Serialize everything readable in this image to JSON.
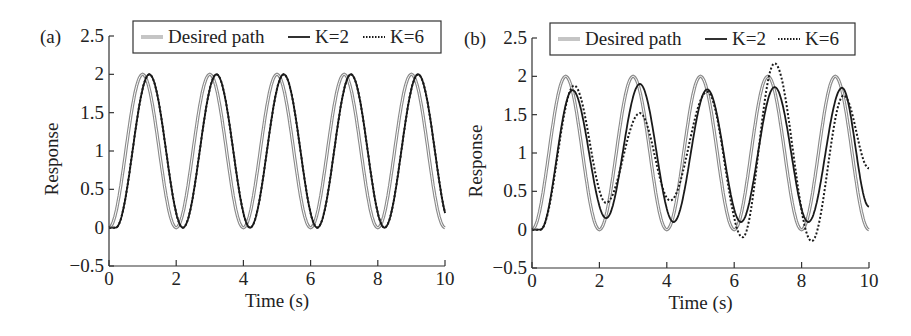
{
  "chart_data": [
    {
      "panel_label": "(a)",
      "type": "line",
      "xlabel": "Time (s)",
      "ylabel": "Response",
      "xlim": [
        0,
        10
      ],
      "ylim": [
        -0.5,
        2.5
      ],
      "xticks": [
        "0",
        "2",
        "4",
        "6",
        "8",
        "10"
      ],
      "yticks": [
        "−0.5",
        "0",
        "0.5",
        "1",
        "1.5",
        "2",
        "2.5"
      ],
      "grid": false,
      "legend": {
        "position": "top-inside",
        "entries": [
          "Desired path",
          "K=2",
          "K=6"
        ]
      },
      "series": [
        {
          "name": "Desired path",
          "style": "gray-double",
          "model": {
            "amp": 1,
            "offset": 1,
            "period": 2,
            "delay": 0
          }
        },
        {
          "name": "K=2",
          "style": "solid",
          "model": {
            "amp": 1,
            "offset": 1,
            "period": 2,
            "delay": 0.2
          }
        },
        {
          "name": "K=6",
          "style": "dotted",
          "model": {
            "amp": 1,
            "offset": 1,
            "period": 2,
            "delay": 0.2
          }
        }
      ]
    },
    {
      "panel_label": "(b)",
      "type": "line",
      "xlabel": "Time (s)",
      "ylabel": "Response",
      "xlim": [
        0,
        10
      ],
      "ylim": [
        -0.5,
        2.5
      ],
      "xticks": [
        "0",
        "2",
        "4",
        "6",
        "8",
        "10"
      ],
      "yticks": [
        "−0.5",
        "0",
        "0.5",
        "1",
        "1.5",
        "2",
        "2.5"
      ],
      "grid": false,
      "legend": {
        "position": "top-inside",
        "entries": [
          "Desired path",
          "K=2",
          "K=6"
        ]
      },
      "series": [
        {
          "name": "Desired path",
          "style": "gray-double",
          "x": [
            0,
            1,
            2,
            3,
            4,
            5,
            6,
            7,
            8,
            9,
            10
          ],
          "y": [
            0,
            2,
            0,
            2,
            0,
            2,
            0,
            2,
            0,
            2,
            0
          ]
        },
        {
          "name": "K=2",
          "style": "solid",
          "x": [
            0,
            0.25,
            1.2,
            2.2,
            3.2,
            4.2,
            5.2,
            6.2,
            7.2,
            8.2,
            9.2,
            10
          ],
          "y": [
            0,
            0,
            1.82,
            0.15,
            1.9,
            0.1,
            1.83,
            0.1,
            1.86,
            0.1,
            1.85,
            0.3
          ]
        },
        {
          "name": "K=6",
          "style": "dotted",
          "x": [
            0,
            0.25,
            1.25,
            2.2,
            3.2,
            4.1,
            5.2,
            6.25,
            7.2,
            8.3,
            9.25,
            10
          ],
          "y": [
            0,
            0,
            1.88,
            0.35,
            1.52,
            0.38,
            1.8,
            -0.1,
            2.17,
            -0.15,
            1.75,
            0.8
          ]
        }
      ]
    }
  ]
}
